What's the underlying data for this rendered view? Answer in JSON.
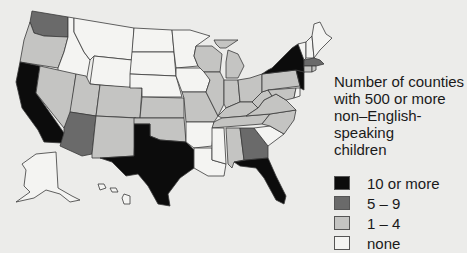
{
  "legend": {
    "title_lines": [
      "Number of counties",
      "with 500 or more",
      "non–English-speaking",
      "children"
    ],
    "items": [
      {
        "label": "10 or more",
        "color": "#0c0c0c"
      },
      {
        "label": "5 – 9",
        "color": "#6a6a6a"
      },
      {
        "label": "1 – 4",
        "color": "#c4c4c2"
      },
      {
        "label": "none",
        "color": "#f4f4f2"
      }
    ]
  },
  "categories": {
    "10 or more": [
      "CA",
      "TX",
      "FL",
      "NY",
      "NJ"
    ],
    "5 - 9": [
      "WA",
      "AZ",
      "GA",
      "MA"
    ],
    "1 - 4": [
      "OR",
      "NV",
      "UT",
      "CO",
      "NM",
      "KS",
      "OK",
      "WI",
      "MI",
      "IL",
      "IN",
      "OH",
      "PA",
      "MO",
      "KY",
      "TN",
      "WV",
      "VA",
      "MD",
      "AL",
      "NC",
      "CT",
      "RI"
    ],
    "none": [
      "ID",
      "MT",
      "WY",
      "ND",
      "SD",
      "NE",
      "MN",
      "IA",
      "AR",
      "LA",
      "MS",
      "SC",
      "ME",
      "NH",
      "VT",
      "DE",
      "AK",
      "HI"
    ]
  },
  "colors": {
    "background": "#ececea",
    "border": "#3a3a3a",
    "text": "#1a1a1a"
  }
}
